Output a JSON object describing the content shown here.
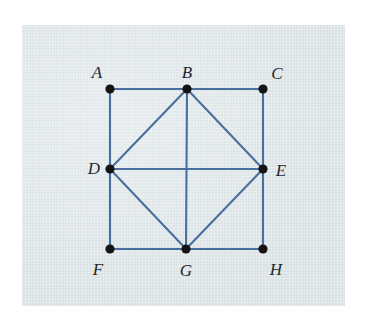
{
  "figure": {
    "caption": "",
    "background_color": "#dfe7ea",
    "page_color": "#ffffff",
    "edge_color": "#486f9e",
    "vertex_color": "#141414",
    "label_color": "#24262b"
  },
  "graph": {
    "type": "undirected-graph",
    "vertices": [
      {
        "id": "A",
        "label": "A",
        "cx": 110,
        "cy": 89,
        "label_x": 97,
        "label_y": 72
      },
      {
        "id": "B",
        "label": "B",
        "cx": 187,
        "cy": 89,
        "label_x": 187,
        "label_y": 72
      },
      {
        "id": "C",
        "label": "C",
        "cx": 263,
        "cy": 89,
        "label_x": 277,
        "label_y": 73
      },
      {
        "id": "D",
        "label": "D",
        "cx": 110,
        "cy": 169,
        "label_x": 94,
        "label_y": 168
      },
      {
        "id": "E",
        "label": "E",
        "cx": 263,
        "cy": 169,
        "label_x": 281,
        "label_y": 170
      },
      {
        "id": "F",
        "label": "F",
        "cx": 110,
        "cy": 249,
        "label_x": 98,
        "label_y": 269
      },
      {
        "id": "G",
        "label": "G",
        "cx": 186,
        "cy": 249,
        "label_x": 186,
        "label_y": 270
      },
      {
        "id": "H",
        "label": "H",
        "cx": 263,
        "cy": 249,
        "label_x": 276,
        "label_y": 269
      }
    ],
    "edges": [
      {
        "from": "A",
        "to": "B"
      },
      {
        "from": "B",
        "to": "C"
      },
      {
        "from": "A",
        "to": "D"
      },
      {
        "from": "D",
        "to": "F"
      },
      {
        "from": "C",
        "to": "E"
      },
      {
        "from": "E",
        "to": "H"
      },
      {
        "from": "F",
        "to": "G"
      },
      {
        "from": "G",
        "to": "H"
      },
      {
        "from": "D",
        "to": "B"
      },
      {
        "from": "B",
        "to": "E"
      },
      {
        "from": "E",
        "to": "G"
      },
      {
        "from": "G",
        "to": "D"
      },
      {
        "from": "D",
        "to": "E"
      },
      {
        "from": "B",
        "to": "G"
      }
    ],
    "vertex_radius": 4.6,
    "edge_width": 2.1
  }
}
